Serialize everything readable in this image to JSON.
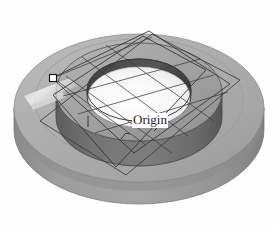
{
  "viewport": {
    "name": "3d-model-viewport",
    "width": 278,
    "height": 227,
    "background_color": "#fefefe",
    "projection": "isometric",
    "render_style": "shaded-with-edges"
  },
  "annotations": {
    "origin_label": "Origin"
  },
  "model": {
    "part_name": "Washer Spacer",
    "description": "Cylindrical disc with raised annular hub and central through-bore",
    "features": [
      {
        "name": "base-disc",
        "type": "cylinder"
      },
      {
        "name": "raised-hub",
        "type": "annular-boss"
      },
      {
        "name": "center-bore",
        "type": "through-hole"
      }
    ]
  },
  "colors": {
    "base_top_face": "#adadad",
    "base_side_wall": "#8f8f8f",
    "base_side_wall_dark": "#858585",
    "hub_top_face": "#9a9a9a",
    "hub_outer_wall": "#6f6f6f",
    "hub_outer_wall_dark": "#5c5c5c",
    "bore_inner_wall": "#4a4a4a",
    "bore_floor": "#f2f2f2",
    "highlight_streak": "#e8e8e8",
    "edge_line": "#2b2b2b",
    "plane_wireframe": "#3a3a3a",
    "handle_fill": "#ffffff",
    "handle_stroke": "#1a1a1a",
    "label_text": "#1a1a1a",
    "label_background": "#ffffff"
  },
  "geometry": {
    "base_disc": {
      "center_x": 139,
      "center_y": 108,
      "radius_x": 125,
      "radius_y": 74,
      "thickness": 22
    },
    "hub": {
      "center_x": 139,
      "center_y": 92,
      "radius_x": 83,
      "radius_y": 49,
      "thickness": 25
    },
    "bore": {
      "center_x": 139,
      "center_y": 90,
      "radius_x": 52,
      "radius_y": 31,
      "depth": 16
    }
  },
  "construction_planes": [
    {
      "name": "ground-plane",
      "label": "Ground Plane",
      "points": "60,122 152,39 217,78 129,167"
    },
    {
      "name": "section-plane-a",
      "label": "Section Plane A",
      "points": "51,93 150,32 230,83 130,156"
    },
    {
      "name": "section-plane-b",
      "label": "Section Plane B",
      "points": "55,127 142,36 205,72 118,171"
    }
  ],
  "grid_lines": [
    "62,96 198,59",
    "76,113 212,74",
    "92,130 226,90",
    "80,59 186,135",
    "64,77 170,152",
    "104,46 212,120"
  ],
  "handles": [
    {
      "name": "plane-vertex-handle",
      "x": 53,
      "y": 78,
      "size": 7,
      "state": "selected"
    }
  ]
}
